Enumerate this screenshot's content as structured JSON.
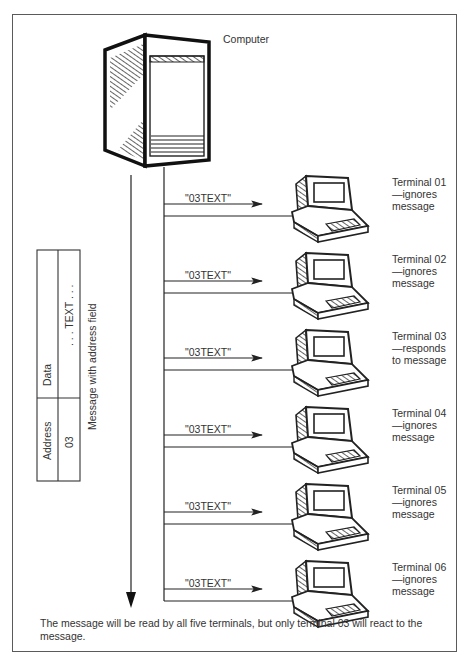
{
  "diagram": {
    "computer_label": "Computer",
    "message_text": "\"03TEXT\"",
    "terminals": [
      {
        "name": "Terminal 01",
        "action_line1": "—ignores",
        "action_line2": "message"
      },
      {
        "name": "Terminal 02",
        "action_line1": "—ignores",
        "action_line2": "message"
      },
      {
        "name": "Terminal 03",
        "action_line1": "—responds",
        "action_line2": "to message"
      },
      {
        "name": "Terminal 04",
        "action_line1": "—ignores",
        "action_line2": "message"
      },
      {
        "name": "Terminal 05",
        "action_line1": "—ignores",
        "action_line2": "message"
      },
      {
        "name": "Terminal 06",
        "action_line1": "—ignores",
        "action_line2": "message"
      }
    ],
    "message_format": {
      "title": "Message with address field",
      "fields": [
        {
          "header": "Address",
          "value": "03"
        },
        {
          "header": "Data",
          "value": ". . . TEXT . . ."
        }
      ]
    },
    "caption": "The message will be read by all five terminals, but only terminal 03 will react to the message.",
    "icons": [
      "computer-cabinet-icon",
      "terminal-icon"
    ],
    "colors": {
      "line": "#222222",
      "text": "#333333",
      "border": "#5a5a5a"
    }
  }
}
